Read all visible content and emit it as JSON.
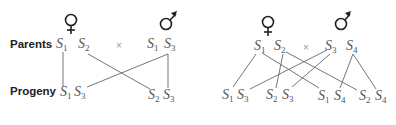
{
  "labels": {
    "parents": "Parents",
    "progeny": "Progeny",
    "cross": "×"
  },
  "symbols": {
    "female": "female-symbol",
    "male": "male-symbol"
  },
  "left_diagram": {
    "parents": {
      "female": [
        {
          "s": "S",
          "n": "1"
        },
        {
          "s": "S",
          "n": "2"
        }
      ],
      "male": [
        {
          "s": "S",
          "n": "1"
        },
        {
          "s": "S",
          "n": "3"
        }
      ]
    },
    "progeny": [
      {
        "s": "S",
        "n": "1"
      },
      {
        "s": "S",
        "n": "3"
      },
      {
        "s": "S",
        "n": "2"
      },
      {
        "s": "S",
        "n": "3"
      }
    ]
  },
  "right_diagram": {
    "parents": {
      "female": [
        {
          "s": "S",
          "n": "1"
        },
        {
          "s": "S",
          "n": "2"
        }
      ],
      "male": [
        {
          "s": "S",
          "n": "3"
        },
        {
          "s": "S",
          "n": "4"
        }
      ]
    },
    "progeny": [
      {
        "s": "S",
        "n": "1"
      },
      {
        "s": "S",
        "n": "3"
      },
      {
        "s": "S",
        "n": "2"
      },
      {
        "s": "S",
        "n": "3"
      },
      {
        "s": "S",
        "n": "1"
      },
      {
        "s": "S",
        "n": "4"
      },
      {
        "s": "S",
        "n": "2"
      },
      {
        "s": "S",
        "n": "4"
      }
    ]
  }
}
